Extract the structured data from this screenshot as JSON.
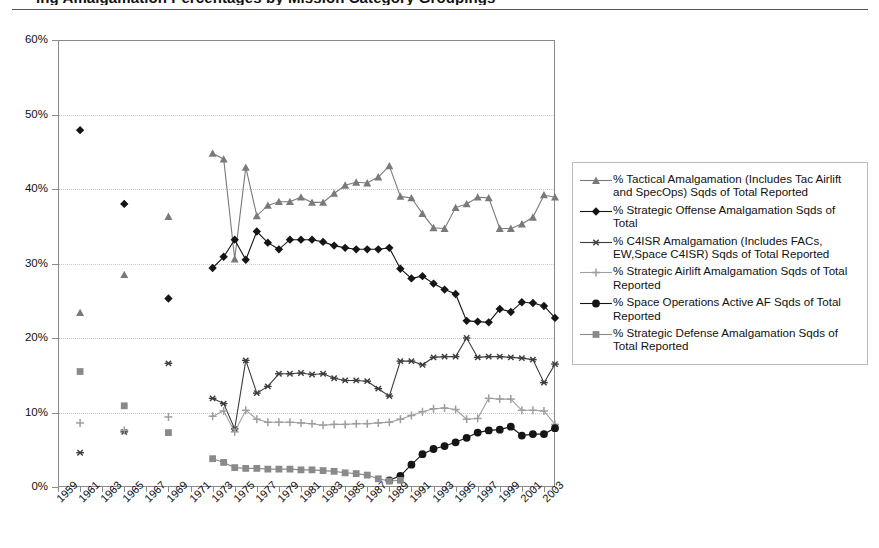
{
  "page": {
    "title_partial": "ing Amalgamation Percentages by Mission Category Groupings",
    "background": "#ffffff"
  },
  "chart_data": {
    "type": "line",
    "title": "",
    "xlabel": "",
    "ylabel": "",
    "ylim": [
      0,
      60
    ],
    "ytick_labels": [
      "0%",
      "10%",
      "20%",
      "30%",
      "40%",
      "50%",
      "60%"
    ],
    "ytick_values": [
      0,
      10,
      20,
      30,
      40,
      50,
      60
    ],
    "grid": "horizontal-dotted",
    "legend_position": "right",
    "x_start": 1959,
    "x_end": 2004,
    "xtick_labels": [
      "1959",
      "1961",
      "1963",
      "1965",
      "1967",
      "1969",
      "1971",
      "1973",
      "1975",
      "1977",
      "1979",
      "1981",
      "1983",
      "1985",
      "1987",
      "1989",
      "1991",
      "1993",
      "1995",
      "1997",
      "1999",
      "2001",
      "2003"
    ],
    "series": [
      {
        "name": "% Tactical Amalgamation (Includes Tac Airlift and SpecOps) Sqds of Total Reported",
        "marker": "triangle",
        "color": "#7a7a7a",
        "points": [
          {
            "x": 1961,
            "y": 23.4
          },
          {
            "x": 1965,
            "y": 28.5
          },
          {
            "x": 1969,
            "y": 36.3
          },
          {
            "x": 1973,
            "y": 44.8
          },
          {
            "x": 1974,
            "y": 44.0
          },
          {
            "x": 1975,
            "y": 30.6
          },
          {
            "x": 1976,
            "y": 42.9
          },
          {
            "x": 1977,
            "y": 36.4
          },
          {
            "x": 1978,
            "y": 37.8
          },
          {
            "x": 1979,
            "y": 38.3
          },
          {
            "x": 1980,
            "y": 38.3
          },
          {
            "x": 1981,
            "y": 38.9
          },
          {
            "x": 1982,
            "y": 38.2
          },
          {
            "x": 1983,
            "y": 38.2
          },
          {
            "x": 1984,
            "y": 39.4
          },
          {
            "x": 1985,
            "y": 40.5
          },
          {
            "x": 1986,
            "y": 40.9
          },
          {
            "x": 1987,
            "y": 40.8
          },
          {
            "x": 1988,
            "y": 41.6
          },
          {
            "x": 1989,
            "y": 43.1
          },
          {
            "x": 1990,
            "y": 39.0
          },
          {
            "x": 1991,
            "y": 38.8
          },
          {
            "x": 1992,
            "y": 36.7
          },
          {
            "x": 1993,
            "y": 34.8
          },
          {
            "x": 1994,
            "y": 34.7
          },
          {
            "x": 1995,
            "y": 37.5
          },
          {
            "x": 1996,
            "y": 38.0
          },
          {
            "x": 1997,
            "y": 38.9
          },
          {
            "x": 1998,
            "y": 38.8
          },
          {
            "x": 1999,
            "y": 34.7
          },
          {
            "x": 2000,
            "y": 34.7
          },
          {
            "x": 2001,
            "y": 35.3
          },
          {
            "x": 2002,
            "y": 36.2
          },
          {
            "x": 2003,
            "y": 39.2
          },
          {
            "x": 2004,
            "y": 38.9
          }
        ]
      },
      {
        "name": "% Strategic Offense Amalgamation Sqds of Total",
        "marker": "diamond",
        "color": "#151515",
        "points": [
          {
            "x": 1961,
            "y": 47.9
          },
          {
            "x": 1965,
            "y": 38.0
          },
          {
            "x": 1969,
            "y": 25.3
          },
          {
            "x": 1973,
            "y": 29.4
          },
          {
            "x": 1974,
            "y": 30.9
          },
          {
            "x": 1975,
            "y": 33.2
          },
          {
            "x": 1976,
            "y": 30.5
          },
          {
            "x": 1977,
            "y": 34.3
          },
          {
            "x": 1978,
            "y": 32.8
          },
          {
            "x": 1979,
            "y": 31.9
          },
          {
            "x": 1980,
            "y": 33.2
          },
          {
            "x": 1981,
            "y": 33.2
          },
          {
            "x": 1982,
            "y": 33.2
          },
          {
            "x": 1983,
            "y": 32.9
          },
          {
            "x": 1984,
            "y": 32.4
          },
          {
            "x": 1985,
            "y": 32.1
          },
          {
            "x": 1986,
            "y": 31.9
          },
          {
            "x": 1987,
            "y": 31.9
          },
          {
            "x": 1988,
            "y": 31.9
          },
          {
            "x": 1989,
            "y": 32.1
          },
          {
            "x": 1990,
            "y": 29.3
          },
          {
            "x": 1991,
            "y": 28.0
          },
          {
            "x": 1992,
            "y": 28.3
          },
          {
            "x": 1993,
            "y": 27.3
          },
          {
            "x": 1994,
            "y": 26.5
          },
          {
            "x": 1995,
            "y": 25.9
          },
          {
            "x": 1996,
            "y": 22.3
          },
          {
            "x": 1997,
            "y": 22.2
          },
          {
            "x": 1998,
            "y": 22.1
          },
          {
            "x": 1999,
            "y": 23.9
          },
          {
            "x": 2000,
            "y": 23.5
          },
          {
            "x": 2001,
            "y": 24.8
          },
          {
            "x": 2002,
            "y": 24.7
          },
          {
            "x": 2003,
            "y": 24.3
          },
          {
            "x": 2004,
            "y": 22.7
          }
        ]
      },
      {
        "name": "% C4ISR Amalgamation (Includes FACs, EW,Space C4ISR) Sqds of Total Reported",
        "marker": "asterisk",
        "color": "#3d3d3d",
        "points": [
          {
            "x": 1961,
            "y": 4.6
          },
          {
            "x": 1965,
            "y": 7.4
          },
          {
            "x": 1969,
            "y": 16.6
          },
          {
            "x": 1973,
            "y": 11.9
          },
          {
            "x": 1974,
            "y": 11.2
          },
          {
            "x": 1975,
            "y": 7.8
          },
          {
            "x": 1976,
            "y": 17.0
          },
          {
            "x": 1977,
            "y": 12.6
          },
          {
            "x": 1978,
            "y": 13.5
          },
          {
            "x": 1979,
            "y": 15.2
          },
          {
            "x": 1980,
            "y": 15.2
          },
          {
            "x": 1981,
            "y": 15.3
          },
          {
            "x": 1982,
            "y": 15.1
          },
          {
            "x": 1983,
            "y": 15.2
          },
          {
            "x": 1984,
            "y": 14.6
          },
          {
            "x": 1985,
            "y": 14.3
          },
          {
            "x": 1986,
            "y": 14.3
          },
          {
            "x": 1987,
            "y": 14.2
          },
          {
            "x": 1988,
            "y": 13.2
          },
          {
            "x": 1989,
            "y": 12.2
          },
          {
            "x": 1990,
            "y": 16.9
          },
          {
            "x": 1991,
            "y": 16.9
          },
          {
            "x": 1992,
            "y": 16.4
          },
          {
            "x": 1993,
            "y": 17.4
          },
          {
            "x": 1994,
            "y": 17.5
          },
          {
            "x": 1995,
            "y": 17.5
          },
          {
            "x": 1996,
            "y": 20.0
          },
          {
            "x": 1997,
            "y": 17.4
          },
          {
            "x": 1998,
            "y": 17.5
          },
          {
            "x": 1999,
            "y": 17.5
          },
          {
            "x": 2000,
            "y": 17.4
          },
          {
            "x": 2001,
            "y": 17.3
          },
          {
            "x": 2002,
            "y": 17.1
          },
          {
            "x": 2003,
            "y": 14.0
          },
          {
            "x": 2004,
            "y": 16.5
          }
        ]
      },
      {
        "name": "% Strategic Airlift Amalgamation Sqds of Total Reported",
        "marker": "plus",
        "color": "#9e9e9e",
        "points": [
          {
            "x": 1961,
            "y": 8.6
          },
          {
            "x": 1965,
            "y": 7.6
          },
          {
            "x": 1969,
            "y": 9.4
          },
          {
            "x": 1973,
            "y": 9.5
          },
          {
            "x": 1974,
            "y": 10.2
          },
          {
            "x": 1975,
            "y": 7.4
          },
          {
            "x": 1976,
            "y": 10.3
          },
          {
            "x": 1977,
            "y": 9.1
          },
          {
            "x": 1978,
            "y": 8.7
          },
          {
            "x": 1979,
            "y": 8.7
          },
          {
            "x": 1980,
            "y": 8.7
          },
          {
            "x": 1981,
            "y": 8.6
          },
          {
            "x": 1982,
            "y": 8.5
          },
          {
            "x": 1983,
            "y": 8.3
          },
          {
            "x": 1984,
            "y": 8.4
          },
          {
            "x": 1985,
            "y": 8.4
          },
          {
            "x": 1986,
            "y": 8.5
          },
          {
            "x": 1987,
            "y": 8.5
          },
          {
            "x": 1988,
            "y": 8.6
          },
          {
            "x": 1989,
            "y": 8.7
          },
          {
            "x": 1990,
            "y": 9.1
          },
          {
            "x": 1991,
            "y": 9.6
          },
          {
            "x": 1992,
            "y": 10.1
          },
          {
            "x": 1993,
            "y": 10.5
          },
          {
            "x": 1994,
            "y": 10.6
          },
          {
            "x": 1995,
            "y": 10.4
          },
          {
            "x": 1996,
            "y": 9.1
          },
          {
            "x": 1997,
            "y": 9.2
          },
          {
            "x": 1998,
            "y": 11.9
          },
          {
            "x": 1999,
            "y": 11.8
          },
          {
            "x": 2000,
            "y": 11.8
          },
          {
            "x": 2001,
            "y": 10.3
          },
          {
            "x": 2002,
            "y": 10.3
          },
          {
            "x": 2003,
            "y": 10.2
          },
          {
            "x": 2004,
            "y": 8.4
          }
        ]
      },
      {
        "name": "% Space Operations Active AF Sqds of Total Reported",
        "marker": "circle",
        "color": "#151515",
        "points": [
          {
            "x": 1989,
            "y": 0.9
          },
          {
            "x": 1990,
            "y": 1.5
          },
          {
            "x": 1991,
            "y": 3.0
          },
          {
            "x": 1992,
            "y": 4.4
          },
          {
            "x": 1993,
            "y": 5.1
          },
          {
            "x": 1994,
            "y": 5.5
          },
          {
            "x": 1995,
            "y": 6.0
          },
          {
            "x": 1996,
            "y": 6.6
          },
          {
            "x": 1997,
            "y": 7.3
          },
          {
            "x": 1998,
            "y": 7.6
          },
          {
            "x": 1999,
            "y": 7.7
          },
          {
            "x": 2000,
            "y": 8.1
          },
          {
            "x": 2001,
            "y": 6.9
          },
          {
            "x": 2002,
            "y": 7.1
          },
          {
            "x": 2003,
            "y": 7.1
          },
          {
            "x": 2004,
            "y": 7.9
          }
        ]
      },
      {
        "name": "% Strategic Defense Amalgamation Sqds of Total Reported",
        "marker": "square",
        "color": "#8a8a8a",
        "points": [
          {
            "x": 1961,
            "y": 15.5
          },
          {
            "x": 1965,
            "y": 10.9
          },
          {
            "x": 1969,
            "y": 7.3
          },
          {
            "x": 1973,
            "y": 3.8
          },
          {
            "x": 1974,
            "y": 3.3
          },
          {
            "x": 1975,
            "y": 2.6
          },
          {
            "x": 1976,
            "y": 2.5
          },
          {
            "x": 1977,
            "y": 2.5
          },
          {
            "x": 1978,
            "y": 2.4
          },
          {
            "x": 1979,
            "y": 2.4
          },
          {
            "x": 1980,
            "y": 2.4
          },
          {
            "x": 1981,
            "y": 2.3
          },
          {
            "x": 1982,
            "y": 2.3
          },
          {
            "x": 1983,
            "y": 2.2
          },
          {
            "x": 1984,
            "y": 2.1
          },
          {
            "x": 1985,
            "y": 1.9
          },
          {
            "x": 1986,
            "y": 1.8
          },
          {
            "x": 1987,
            "y": 1.6
          },
          {
            "x": 1988,
            "y": 1.1
          },
          {
            "x": 1989,
            "y": 0.8
          },
          {
            "x": 1990,
            "y": 0.9
          }
        ]
      }
    ]
  },
  "legend": {
    "items": [
      {
        "label": "% Tactical Amalgamation (Includes Tac Airlift and SpecOps) Sqds of Total Reported",
        "marker": "triangle",
        "color": "#7a7a7a"
      },
      {
        "label": "% Strategic Offense Amalgamation Sqds of Total",
        "marker": "diamond",
        "color": "#151515"
      },
      {
        "label": "% C4ISR Amalgamation (Includes FACs, EW,Space C4ISR) Sqds of Total Reported",
        "marker": "asterisk",
        "color": "#3d3d3d"
      },
      {
        "label": "% Strategic Airlift Amalgamation Sqds of Total Reported",
        "marker": "plus",
        "color": "#9e9e9e"
      },
      {
        "label": "% Space Operations Active AF Sqds of Total Reported",
        "marker": "circle",
        "color": "#151515"
      },
      {
        "label": "% Strategic Defense Amalgamation Sqds of Total Reported",
        "marker": "square",
        "color": "#8a8a8a"
      }
    ]
  }
}
